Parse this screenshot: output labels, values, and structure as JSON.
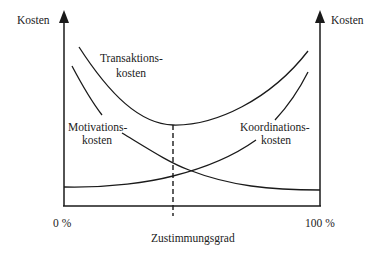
{
  "diagram": {
    "left_axis_label": "Kosten",
    "right_axis_label": "Kosten",
    "x_axis_label": "Zustimmungsgrad",
    "x_min_label": "0 %",
    "x_max_label": "100 %",
    "curves": {
      "transaction": {
        "label_line1": "Transaktions-",
        "label_line2": "kosten"
      },
      "motivation": {
        "label_line1": "Motivations-",
        "label_line2": "kosten"
      },
      "coordination": {
        "label_line1": "Koordinations-",
        "label_line2": "kosten"
      }
    },
    "optimum_marker": "dashed vertical line at minimum of transaction costs"
  }
}
